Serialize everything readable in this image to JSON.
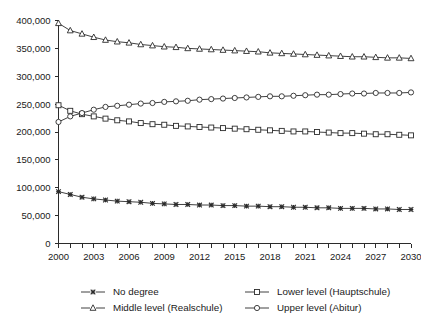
{
  "chart_data": {
    "type": "line",
    "title": "",
    "subtitle": "",
    "xlabel": "",
    "ylabel": "",
    "xlim": [
      2000,
      2030
    ],
    "ylim": [
      0,
      400000
    ],
    "grid": false,
    "legend_position": "bottom",
    "x": [
      2000,
      2001,
      2002,
      2003,
      2004,
      2005,
      2006,
      2007,
      2008,
      2009,
      2010,
      2011,
      2012,
      2013,
      2014,
      2015,
      2016,
      2017,
      2018,
      2019,
      2020,
      2021,
      2022,
      2023,
      2024,
      2025,
      2026,
      2027,
      2028,
      2029,
      2030
    ],
    "xticks": [
      2000,
      2003,
      2006,
      2009,
      2012,
      2015,
      2018,
      2021,
      2024,
      2027,
      2030
    ],
    "xtick_labels": [
      "2000",
      "2003",
      "2006",
      "2009",
      "2012",
      "2015",
      "2018",
      "2021",
      "2024",
      "2027",
      "2030"
    ],
    "yticks": [
      0,
      50000,
      100000,
      150000,
      200000,
      250000,
      300000,
      350000,
      400000
    ],
    "ytick_labels": [
      "0",
      "50,000",
      "100,000",
      "150,000",
      "200,000",
      "250,000",
      "300,000",
      "350,000",
      "400,000"
    ],
    "series": [
      {
        "name": "No degree",
        "marker": "x",
        "values": [
          93000,
          88000,
          83000,
          80000,
          78000,
          76000,
          75000,
          74000,
          72000,
          71000,
          70000,
          70000,
          69000,
          69000,
          68000,
          68000,
          67000,
          67000,
          66000,
          66000,
          65000,
          65000,
          64000,
          64000,
          63000,
          63000,
          63000,
          62000,
          62000,
          61000,
          61000
        ]
      },
      {
        "name": "Lower level (Hauptschule)",
        "marker": "square",
        "values": [
          248000,
          238000,
          232000,
          228000,
          224000,
          221000,
          219000,
          216000,
          214000,
          213000,
          211000,
          210000,
          209000,
          208000,
          207000,
          206000,
          205000,
          204000,
          203000,
          202000,
          201000,
          201000,
          200000,
          199000,
          198000,
          198000,
          197000,
          196000,
          196000,
          195000,
          194000
        ]
      },
      {
        "name": "Middle level (Realschule)",
        "marker": "triangle",
        "values": [
          395000,
          382000,
          376000,
          370000,
          365000,
          362000,
          360000,
          357000,
          355000,
          353000,
          352000,
          350000,
          349000,
          348000,
          347000,
          346000,
          345000,
          344000,
          342000,
          341000,
          340000,
          339000,
          338000,
          337000,
          336000,
          335000,
          335000,
          334000,
          333000,
          333000,
          332000
        ]
      },
      {
        "name": "Upper level (Abitur)",
        "marker": "circle",
        "values": [
          218000,
          228000,
          234000,
          240000,
          245000,
          247000,
          249000,
          251000,
          252000,
          254000,
          255000,
          256000,
          258000,
          259000,
          260000,
          261000,
          262000,
          263000,
          264000,
          264000,
          265000,
          266000,
          267000,
          267000,
          268000,
          269000,
          269000,
          270000,
          270000,
          270000,
          271000
        ]
      }
    ]
  },
  "legend": {
    "items": [
      {
        "label": "No degree",
        "marker": "x"
      },
      {
        "label": "Lower level (Hauptschule)",
        "marker": "square"
      },
      {
        "label": "Middle level (Realschule)",
        "marker": "triangle"
      },
      {
        "label": "Upper level (Abitur)",
        "marker": "circle"
      }
    ]
  },
  "colors": {
    "ink": "#2b2b2b",
    "background": "#ffffff",
    "marker_fill": "#ffffff"
  }
}
